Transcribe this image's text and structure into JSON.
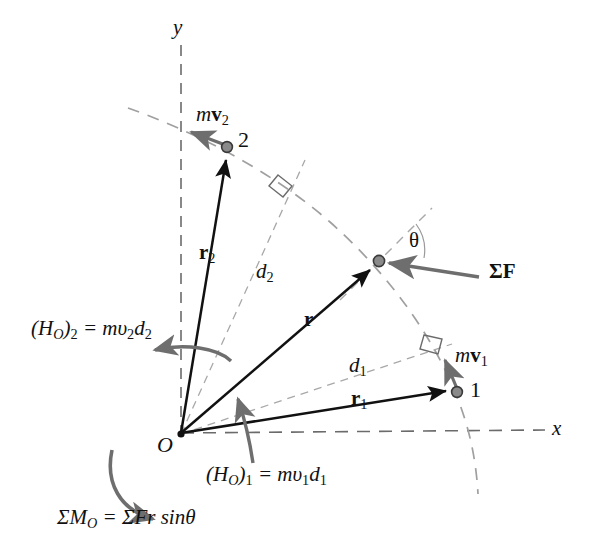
{
  "figure": {
    "background_color": "#ffffff",
    "width": 594,
    "height": 558
  },
  "colors": {
    "solid_vector": "#111111",
    "dashed_construction": "#9a9a9a",
    "dashed_axis": "#6b6b6b",
    "curved_moment_arrow": "#6e6e6e",
    "force_arrow": "#6e6e6e",
    "momentum_arrow": "#6e6e6e",
    "particle_fill": "#8a8a8a",
    "particle_stroke": "#3a3a3a",
    "text": "#111111"
  },
  "axes": {
    "y_label": "y",
    "x_label": "x",
    "origin_label": "O",
    "style": "dashed"
  },
  "points": [
    {
      "id": "p1",
      "label": "1",
      "x": 457,
      "y": 392
    },
    {
      "id": "p2",
      "label": "2",
      "x": 227,
      "y": 147
    },
    {
      "id": "pr",
      "label": "",
      "x": 379,
      "y": 261
    },
    {
      "id": "origin",
      "label": "O",
      "x": 181,
      "y": 434
    }
  ],
  "vectors": {
    "r": {
      "label_html": "<b>r</b>",
      "label_plain": "r",
      "from": "O",
      "to": "pr"
    },
    "r1": {
      "label_html": "<b>r</b><sub class=\"up\">1</sub>",
      "label_plain": "r1",
      "from": "O",
      "to": "p1"
    },
    "r2": {
      "label_html": "<b>r</b><sub class=\"up\">2</sub>",
      "label_plain": "r2",
      "from": "O",
      "to": "p2"
    },
    "mv1": {
      "label_html": "m<b>v</b><sub class=\"up\">1</sub>",
      "label_plain": "mv1",
      "at": "p1"
    },
    "mv2": {
      "label_html": "m<b>v</b><sub class=\"up\">2</sub>",
      "label_plain": "mv2",
      "at": "p2"
    },
    "sumF": {
      "label_html": "&Sigma;<b>F</b>",
      "label_plain": "SigmaF",
      "at": "pr"
    }
  },
  "distances": {
    "d1": {
      "label_html": "d<sub class=\"up\">1</sub>",
      "label_plain": "d1"
    },
    "d2": {
      "label_html": "d<sub class=\"up\">2</sub>",
      "label_plain": "d2"
    }
  },
  "angle": {
    "theta_label": "θ"
  },
  "equations": {
    "ho2": "(H<sub>O</sub>)<sub class=\"up\">2</sub> = mυ<sub class=\"up\">2</sub>d<sub class=\"up\">2</sub>",
    "ho2_plain": "(H_O)_2 = m v_2 d_2",
    "ho1": "(H<sub>O</sub>)<sub class=\"up\">1</sub> = mυ<sub class=\"up\">1</sub>d<sub class=\"up\">1</sub>",
    "ho1_plain": "(H_O)_1 = m v_1 d_1",
    "moment": "ΣM<sub>O</sub> = ΣFr sinθ",
    "moment_plain": "Sigma M_O = Sigma F r sin theta"
  },
  "chart_data": {
    "type": "diagram",
    "elements": [
      {
        "name": "y-axis",
        "type": "dashed-line",
        "from": [
          181,
          45
        ],
        "to": [
          181,
          434
        ]
      },
      {
        "name": "x-axis",
        "type": "dashed-line",
        "from": [
          181,
          434
        ],
        "to": [
          545,
          430
        ]
      },
      {
        "name": "trajectory",
        "type": "dashed-arc",
        "points": [
          [
            130,
            110
          ],
          [
            227,
            147
          ],
          [
            310,
            195
          ],
          [
            379,
            261
          ],
          [
            440,
            340
          ],
          [
            468,
            430
          ],
          [
            478,
            492
          ]
        ]
      },
      {
        "name": "r2-vector",
        "type": "solid-arrow",
        "from": [
          181,
          434
        ],
        "to": [
          227,
          152
        ]
      },
      {
        "name": "r-vector",
        "type": "solid-arrow",
        "from": [
          181,
          434
        ],
        "to": [
          374,
          266
        ]
      },
      {
        "name": "r1-vector",
        "type": "solid-arrow",
        "from": [
          181,
          434
        ],
        "to": [
          451,
          392
        ]
      },
      {
        "name": "d2-line",
        "type": "dashed-line",
        "from": [
          181,
          434
        ],
        "to": [
          300,
          170
        ]
      },
      {
        "name": "d1-line",
        "type": "dashed-line",
        "from": [
          181,
          434
        ],
        "to": [
          446,
          350
        ]
      },
      {
        "name": "mv2-arrow",
        "type": "gray-arrow",
        "from": [
          227,
          147
        ],
        "to": [
          190,
          132
        ]
      },
      {
        "name": "mv1-arrow",
        "type": "gray-arrow",
        "from": [
          457,
          392
        ],
        "to": [
          444,
          359
        ]
      },
      {
        "name": "sumF-arrow",
        "type": "gray-arrow",
        "from": [
          478,
          276
        ],
        "to": [
          388,
          262
        ]
      },
      {
        "name": "theta-angle",
        "type": "angle-mark",
        "vertex": [
          379,
          261
        ]
      },
      {
        "name": "ho2-moment-arc",
        "type": "curved-arrow",
        "direction": "counterclockwise"
      },
      {
        "name": "ho1-moment-arc",
        "type": "curved-arrow",
        "direction": "counterclockwise"
      },
      {
        "name": "sumMo-moment-arc",
        "type": "curved-arrow",
        "direction": "clockwise"
      },
      {
        "name": "right-angle-d2",
        "type": "square-mark",
        "at": [
          284,
          186
        ]
      },
      {
        "name": "right-angle-d1",
        "type": "square-mark",
        "at": [
          432,
          348
        ]
      }
    ]
  }
}
